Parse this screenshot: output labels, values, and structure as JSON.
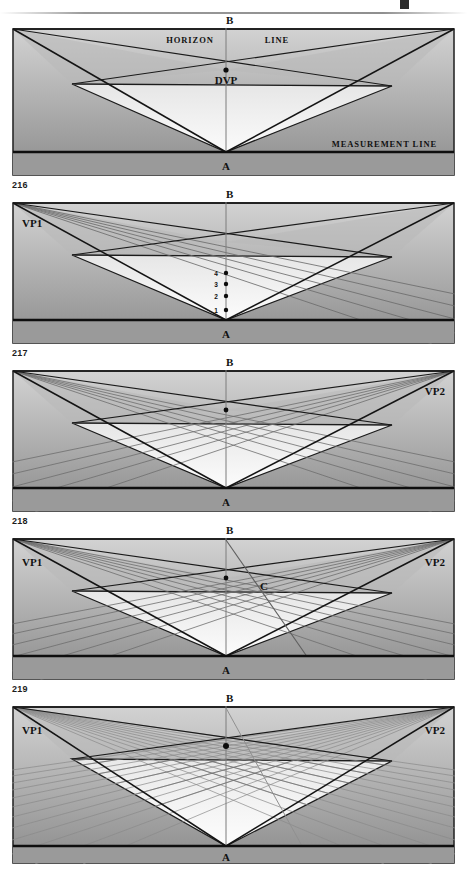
{
  "document": {
    "type": "perspective-drawing-instruction-plate",
    "page_rule": true,
    "background": "#ffffff"
  },
  "labels": {
    "apex_top": "B",
    "apex_bottom": "A",
    "vp_left": "VP1",
    "vp_right": "VP2",
    "dvp": "DVP",
    "horizon_left": "HORIZON",
    "horizon_right": "LINE",
    "measurement_line": "MEASUREMENT LINE",
    "point_c": "C"
  },
  "tick_labels": [
    "1",
    "2",
    "3",
    "4"
  ],
  "figure_numbers": {
    "fig1": "216",
    "fig2": "217",
    "fig3": "218",
    "fig4": "219"
  },
  "panels": [
    {
      "id": "panel-216",
      "figure_number": "216",
      "shows": [
        "horizon-line",
        "dvp",
        "measurement-line",
        "apex-a",
        "apex-b",
        "central-cone"
      ],
      "labels": [
        "B",
        "HORIZON",
        "LINE",
        "DVP",
        "MEASUREMENT LINE",
        "A"
      ],
      "converging_lines_left": 0,
      "converging_lines_right": 0,
      "grid_density": "none"
    },
    {
      "id": "panel-217",
      "figure_number": "217",
      "shows": [
        "vp1",
        "measurement-ticks",
        "apex-a",
        "apex-b"
      ],
      "labels": [
        "B",
        "VP1",
        "4",
        "3",
        "2",
        "1",
        "A"
      ],
      "converging_lines_left": 5,
      "converging_lines_right": 0,
      "grid_density": "left-only"
    },
    {
      "id": "panel-218",
      "figure_number": "218",
      "shows": [
        "vp2",
        "crossing-lines",
        "apex-a",
        "apex-b"
      ],
      "labels": [
        "B",
        "VP2",
        "A"
      ],
      "converging_lines_left": 5,
      "converging_lines_right": 5,
      "grid_density": "medium"
    },
    {
      "id": "panel-219",
      "figure_number": "219",
      "shows": [
        "vp1",
        "vp2",
        "diagonal-c",
        "apex-a",
        "apex-b"
      ],
      "labels": [
        "B",
        "VP1",
        "VP2",
        "C",
        "A"
      ],
      "converging_lines_left": 6,
      "converging_lines_right": 6,
      "grid_density": "medium"
    },
    {
      "id": "panel-final",
      "figure_number": "",
      "shows": [
        "vp1",
        "vp2",
        "dense-grid",
        "diagonal-c",
        "apex-a",
        "apex-b"
      ],
      "labels": [
        "B",
        "VP1",
        "VP2",
        "A"
      ],
      "converging_lines_left": 12,
      "converging_lines_right": 12,
      "grid_density": "dense"
    }
  ],
  "colors": {
    "ink": "#111111",
    "sky_top": "#cfcfcf",
    "sky_bottom": "#8e8e8e",
    "ground_plane_light": "#f7f7f7",
    "ground_plane_shadow": "#e2e2e2",
    "base_band": "#9b9b9b",
    "construction_line": "#6d6d6d",
    "frame": "#2a2a2a"
  }
}
